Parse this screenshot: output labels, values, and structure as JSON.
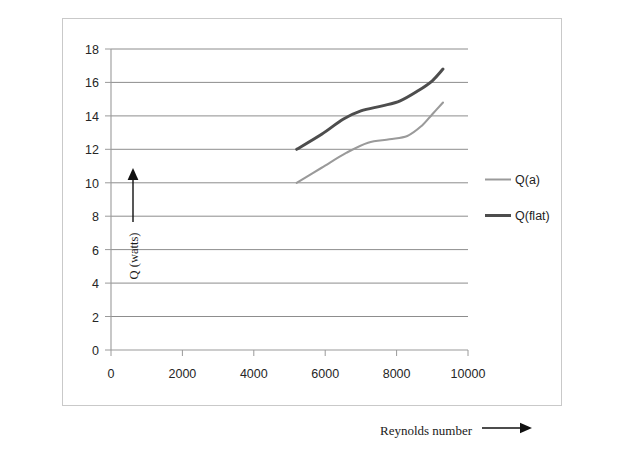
{
  "figure": {
    "background_color": "#ffffff",
    "frame_border_color": "#c9c9c9"
  },
  "axis_titles": {
    "y": "Q (watts)",
    "x": "Reynolds number",
    "y_arrow": "up-arrow",
    "x_arrow": "right-arrow"
  },
  "chart_data": {
    "type": "line",
    "title": "",
    "subtitle": "",
    "xlabel": "Reynolds number",
    "ylabel": "Q (watts)",
    "xlim": [
      0,
      10000
    ],
    "ylim": [
      0,
      18
    ],
    "xticks": [
      0,
      2000,
      4000,
      6000,
      8000,
      10000
    ],
    "xtick_labels": [
      "0",
      "2000",
      "4000",
      "6000",
      "8000",
      "10000"
    ],
    "yticks": [
      0,
      2,
      4,
      6,
      8,
      10,
      12,
      14,
      16,
      18
    ],
    "ytick_labels": [
      "0",
      "2",
      "4",
      "6",
      "8",
      "10",
      "12",
      "14",
      "16",
      "18"
    ],
    "grid": "horizontal",
    "grid_color": "#808080",
    "legend_position": "right",
    "series": [
      {
        "name": "Q(a)",
        "color": "#9a9a9a",
        "line_width": 2.1,
        "x": [
          5200,
          5900,
          6600,
          7200,
          7800,
          8300,
          8700,
          9000,
          9300
        ],
        "values": [
          10.0,
          10.9,
          11.8,
          12.4,
          12.6,
          12.8,
          13.4,
          14.1,
          14.8
        ]
      },
      {
        "name": "Q(flat)",
        "color": "#4d4d4d",
        "line_width": 3.0,
        "x": [
          5200,
          5900,
          6500,
          7000,
          7600,
          8100,
          8600,
          9000,
          9300
        ],
        "values": [
          12.0,
          12.9,
          13.8,
          14.3,
          14.6,
          14.9,
          15.5,
          16.1,
          16.8
        ]
      }
    ]
  },
  "legend": {
    "entries": [
      {
        "label": "Q(a)",
        "color": "#9a9a9a",
        "line_width": 2
      },
      {
        "label": "Q(flat)",
        "color": "#4d4d4d",
        "line_width": 3
      }
    ]
  }
}
